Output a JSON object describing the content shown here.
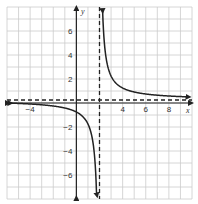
{
  "chart_data": {
    "type": "line",
    "title": "",
    "xlabel": "x",
    "ylabel": "y",
    "xlim": [
      -6,
      10
    ],
    "ylim": [
      -8,
      8
    ],
    "grid": true,
    "x_ticks": [
      -4,
      4,
      6,
      8
    ],
    "x_tick_labels": [
      "−4",
      "4",
      "6",
      "8"
    ],
    "y_ticks": [
      6,
      4,
      2,
      -2,
      -4,
      -6
    ],
    "y_tick_labels": [
      "6",
      "4",
      "2",
      "−2",
      "−4",
      "−6"
    ],
    "asymptotes": {
      "vertical": {
        "x": 2,
        "style": "dashed"
      },
      "horizontal": {
        "y": 0.25,
        "style": "dashed"
      }
    },
    "series": [
      {
        "name": "rational function (left branch)",
        "function": "2/(x-2)+0.25",
        "x": [
          -6,
          -4,
          -2,
          -1,
          0,
          1,
          1.5,
          1.75
        ],
        "values": [
          0,
          -0.08,
          -0.25,
          -0.42,
          -0.75,
          -1.75,
          -3.75,
          -7.75
        ]
      },
      {
        "name": "rational function (right branch)",
        "function": "2/(x-2)+0.25",
        "x": [
          2.25,
          2.5,
          3,
          4,
          6,
          8,
          10
        ],
        "values": [
          8.25,
          4.25,
          2.25,
          1.25,
          0.75,
          0.58,
          0.5
        ]
      }
    ],
    "colors": {
      "curve": "#222222",
      "grid": "#cccccc",
      "axes": "#222222",
      "asymptote": "#222222"
    }
  }
}
